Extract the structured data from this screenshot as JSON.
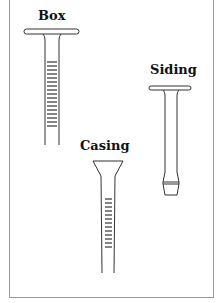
{
  "figure": {
    "labels": {
      "box": "Box",
      "siding": "Siding",
      "casing": "Casing"
    },
    "nails": [
      {
        "name": "Box",
        "head": "flat-wide",
        "shank": "ringed"
      },
      {
        "name": "Siding",
        "head": "flat-wide",
        "shank": "smooth-with-collar-tip"
      },
      {
        "name": "Casing",
        "head": "conical",
        "shank": "ringed"
      }
    ],
    "colors": {
      "stroke": "#333333",
      "frame": "#999999"
    }
  }
}
